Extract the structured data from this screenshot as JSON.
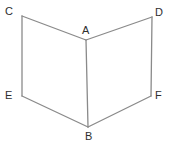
{
  "figure": {
    "background_color": "#ffffff",
    "stroke_color": "#8a8a8a",
    "stroke_width": 1.3,
    "label_color": "#2e2e2e",
    "vertices": [
      {
        "id": "A",
        "label": "A",
        "x": 86,
        "y": 40,
        "label_x": 82,
        "label_y": 25
      },
      {
        "id": "B",
        "label": "B",
        "x": 88,
        "y": 127,
        "label_x": 85,
        "label_y": 131
      },
      {
        "id": "C",
        "label": "C",
        "x": 22,
        "y": 16,
        "label_x": 5,
        "label_y": 6
      },
      {
        "id": "D",
        "label": "D",
        "x": 152,
        "y": 17,
        "label_x": 155,
        "label_y": 7
      },
      {
        "id": "E",
        "label": "E",
        "x": 22,
        "y": 96,
        "label_x": 5,
        "label_y": 90
      },
      {
        "id": "F",
        "label": "F",
        "x": 151,
        "y": 96,
        "label_x": 155,
        "label_y": 90
      }
    ],
    "edges": [
      {
        "id": "CA",
        "from": "C",
        "to": "A"
      },
      {
        "id": "AD",
        "from": "A",
        "to": "D"
      },
      {
        "id": "CE",
        "from": "C",
        "to": "E"
      },
      {
        "id": "DF",
        "from": "D",
        "to": "F"
      },
      {
        "id": "AB",
        "from": "A",
        "to": "B"
      },
      {
        "id": "EB",
        "from": "E",
        "to": "B"
      },
      {
        "id": "BF",
        "from": "B",
        "to": "F"
      }
    ]
  }
}
